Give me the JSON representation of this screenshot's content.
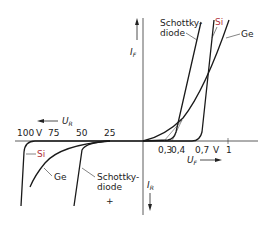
{
  "diagram": {
    "axes": {
      "forward_current_label": "I",
      "forward_current_sub": "F",
      "reverse_current_label": "I",
      "reverse_current_sub": "R",
      "forward_voltage_label": "U",
      "forward_voltage_sub": "F",
      "reverse_voltage_label": "U",
      "reverse_voltage_sub": "R"
    },
    "forward_ticks": [
      "0,3",
      "0,4",
      "0,7",
      "V",
      "1"
    ],
    "reverse_ticks": [
      "100",
      "V",
      "75",
      "50",
      "25"
    ],
    "labels": {
      "schottky_top_1": "Schottky-",
      "schottky_top_2": "diode",
      "si_top": "Si",
      "ge_top": "Ge",
      "si_bottom": "Si",
      "ge_bottom": "Ge",
      "schottky_bottom_1": "Schottky-",
      "schottky_bottom_2": "diode"
    },
    "colors": {
      "line": "#1a1a1a",
      "si_label": "#b0303a",
      "axis": "#333333"
    }
  }
}
